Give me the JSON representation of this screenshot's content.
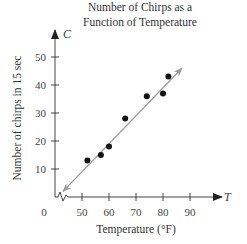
{
  "chart_data": {
    "type": "scatter",
    "title_lines": [
      "Number of Chirps as a",
      "Function of Temperature"
    ],
    "xlabel": "Temperature (°F)",
    "ylabel": "Number of chirps in 15 sec",
    "x_var": "T",
    "y_var": "C",
    "x_ticks": [
      50,
      60,
      70,
      80,
      90
    ],
    "y_ticks": [
      10,
      20,
      30,
      40,
      50
    ],
    "origin_label": "0",
    "axis_break": "x",
    "xlim": [
      40,
      98
    ],
    "ylim": [
      0,
      60
    ],
    "grid": false,
    "legend": null,
    "series": [
      {
        "name": "observations",
        "points": [
          {
            "x": 52,
            "y": 13
          },
          {
            "x": 57,
            "y": 15
          },
          {
            "x": 60,
            "y": 18
          },
          {
            "x": 66,
            "y": 28
          },
          {
            "x": 74,
            "y": 36
          },
          {
            "x": 80,
            "y": 37
          },
          {
            "x": 82,
            "y": 43
          }
        ]
      }
    ],
    "fit_line": {
      "type": "linear",
      "bidirectional_arrow": true,
      "start": {
        "x": 43,
        "y": 2
      },
      "end": {
        "x": 87,
        "y": 46
      },
      "color": "#9a9a9a"
    },
    "colors": {
      "points": "#111111",
      "axes": "#333333",
      "fit_line": "#9a9a9a"
    }
  }
}
